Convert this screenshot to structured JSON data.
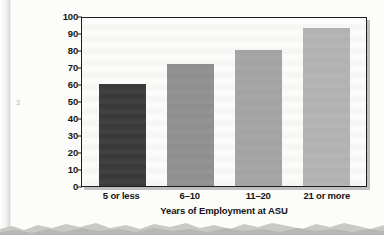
{
  "chart_data": {
    "type": "bar",
    "title": "",
    "categories": [
      "5 or less",
      "6–10",
      "11–20",
      "21 or more"
    ],
    "values": [
      60,
      72,
      80,
      93
    ],
    "xlabel": "Years of Employment at ASU",
    "ylabel": "Percent Familiar with Benefit",
    "ylim": [
      0,
      100
    ],
    "ytick_labels": [
      "100",
      "90",
      "80",
      "70",
      "60",
      "50",
      "40",
      "30",
      "20",
      "10",
      "0"
    ],
    "ytick_values": [
      100,
      90,
      80,
      70,
      60,
      50,
      40,
      30,
      20,
      10,
      0
    ],
    "ytick_step": 10,
    "grid": false,
    "legend": null,
    "bar_colors": [
      "#3a3a3a",
      "#8f8f8f",
      "#a3a3a3",
      "#b2b2b2"
    ],
    "series": [
      {
        "name": "Percent Familiar with Benefit",
        "values": [
          60,
          72,
          80,
          93
        ]
      }
    ]
  },
  "figure": {
    "plot_background": "#fbfbf9",
    "page_background": "#fcfcfa",
    "frame_color": "#1d1d1d",
    "text_color": "#141414",
    "margin_mark": "3"
  }
}
